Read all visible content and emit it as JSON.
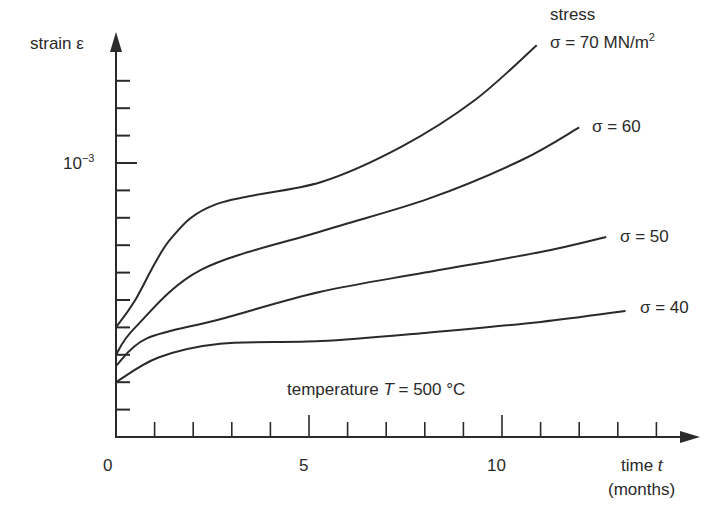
{
  "chart_data": {
    "type": "line",
    "title": "",
    "xlabel": "time t (months)",
    "ylabel": "strain ε",
    "x_ticks": [
      0,
      5,
      10
    ],
    "x_minor_step": 1,
    "y_tick_labels": [
      {
        "value": 0.001,
        "label": "10^-3"
      }
    ],
    "y_minor_step": 0.0001,
    "xlim": [
      0,
      15
    ],
    "ylim": [
      0,
      0.0014
    ],
    "grid": false,
    "annotation": "temperature T = 500 °C",
    "legend_position": "inline at curve ends",
    "series": [
      {
        "name": "σ = 70 MN/m²",
        "x": [
          0,
          0.5,
          1.4,
          2.6,
          5.3,
          7.4,
          9.3,
          10.9
        ],
        "y": [
          0.0004,
          0.0005,
          0.00072,
          0.00085,
          0.00093,
          0.00106,
          0.00123,
          0.00143
        ]
      },
      {
        "name": "σ = 60",
        "x": [
          0,
          0.5,
          2.2,
          5.3,
          8.1,
          10.5,
          12.0
        ],
        "y": [
          0.0003,
          0.0004,
          0.00061,
          0.00075,
          0.00087,
          0.00101,
          0.00113
        ]
      },
      {
        "name": "σ = 50",
        "x": [
          0,
          0.8,
          2.7,
          5.3,
          8.0,
          11.0,
          12.7
        ],
        "y": [
          0.00026,
          0.00036,
          0.00043,
          0.00053,
          0.0006,
          0.000675,
          0.00073
        ]
      },
      {
        "name": "σ = 40",
        "x": [
          0,
          1.1,
          2.7,
          5.3,
          8.0,
          11.0,
          13.2
        ],
        "y": [
          0.0002,
          0.00029,
          0.00034,
          0.00035,
          0.00038,
          0.00042,
          0.00046
        ]
      }
    ]
  },
  "labels": {
    "y_axis": "strain ε",
    "y_tick_1e3_base": "10",
    "y_tick_1e3_exp": "−3",
    "x_tick_0": "0",
    "x_tick_5": "5",
    "x_tick_10": "10",
    "x_axis_line1_prefix": "time ",
    "x_axis_line1_var": "t",
    "x_axis_line2": "(months)",
    "stress_heading": "stress",
    "sigma70_main": "σ = 70 MN/m",
    "sigma70_sup": "2",
    "sigma60": "σ = 60",
    "sigma50": "σ = 50",
    "sigma40": "σ = 40",
    "temp_prefix": "temperature ",
    "temp_var": "T",
    "temp_suffix": " = 500 °C"
  },
  "colors": {
    "ink": "#2a2a2a",
    "background": "#ffffff"
  }
}
